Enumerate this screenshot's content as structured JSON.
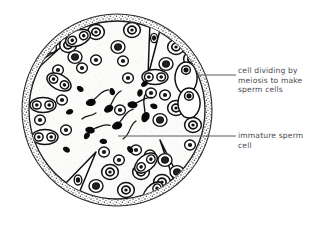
{
  "diagram": {
    "colors": {
      "ink": "#1a1a1a",
      "wall_stipple": "#555555",
      "interior_fill": "#fbfbfa",
      "label_text": "#4a4a50",
      "leader_line": "#5a5a60",
      "background": "#ffffff"
    },
    "structure": {
      "shape": "circle",
      "center_x": 117,
      "center_y": 110,
      "radius": 95,
      "wall_style": "double stippled outline",
      "interior_texture": "light speckled stipple"
    }
  },
  "labels": [
    {
      "id": "meiosis",
      "name": "cell-dividing-by-meiosis-label",
      "text": "cell dividing by\nmeiosis to make\nsperm cells",
      "lines": [
        "cell dividing by",
        "meiosis to make",
        "sperm cells"
      ],
      "leader": {
        "x1": 196,
        "y1": 75,
        "x2": 236,
        "y2": 75
      },
      "points_to": "elongated spermatid near tubule wall, upper right"
    },
    {
      "id": "immature",
      "name": "immature-sperm-cell-label",
      "text": "immature sperm\ncell",
      "lines": [
        "immature sperm",
        "cell"
      ],
      "leader": {
        "x1": 118,
        "y1": 136,
        "x2": 236,
        "y2": 136
      },
      "points_to": "immature sperm cell with tail in lumen of the tubule"
    }
  ],
  "features": {
    "sperm_cells": {
      "name": "sperm-cells-in-lumen",
      "count": 9,
      "description": "dark comma-shaped heads with long curved tails in the central lumen"
    },
    "loose_heads": {
      "name": "detached-sperm-heads",
      "count": 8,
      "description": "small solid black teardrop shapes scattered in the lumen"
    },
    "germ_cells": {
      "name": "germ-cell-rings",
      "count": 45,
      "description": "round cells drawn as an outer ring with a dark nucleus inside, lining the tubule"
    },
    "dividing_pairs": {
      "name": "dividing-cell-pairs",
      "count": 7,
      "description": "paired cells sharing an outline, shown dividing by meiosis"
    },
    "sertoli_cells": {
      "name": "sertoli-cell-wedges",
      "count": 4,
      "description": "narrow triangular cells pointing inward from the tubule wall"
    }
  }
}
